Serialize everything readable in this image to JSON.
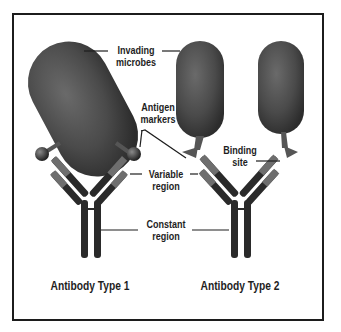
{
  "figure": {
    "labels": {
      "invading_microbes": [
        "Invading",
        "microbes"
      ],
      "antigen_markers": [
        "Antigen",
        "markers"
      ],
      "binding_site": [
        "Binding",
        "site"
      ],
      "variable_region": [
        "Variable",
        "region"
      ],
      "constant_region": [
        "Constant",
        "region"
      ]
    },
    "captions": {
      "type1": "Antibody Type 1",
      "type2": "Antibody Type 2"
    },
    "colors": {
      "microbe": "#4a4a4a",
      "antibody_dark": "#2a2a2a",
      "antibody_mid": "#6e6e6e",
      "frame": "#1c1c1c",
      "text": "#1e1e1e"
    }
  }
}
